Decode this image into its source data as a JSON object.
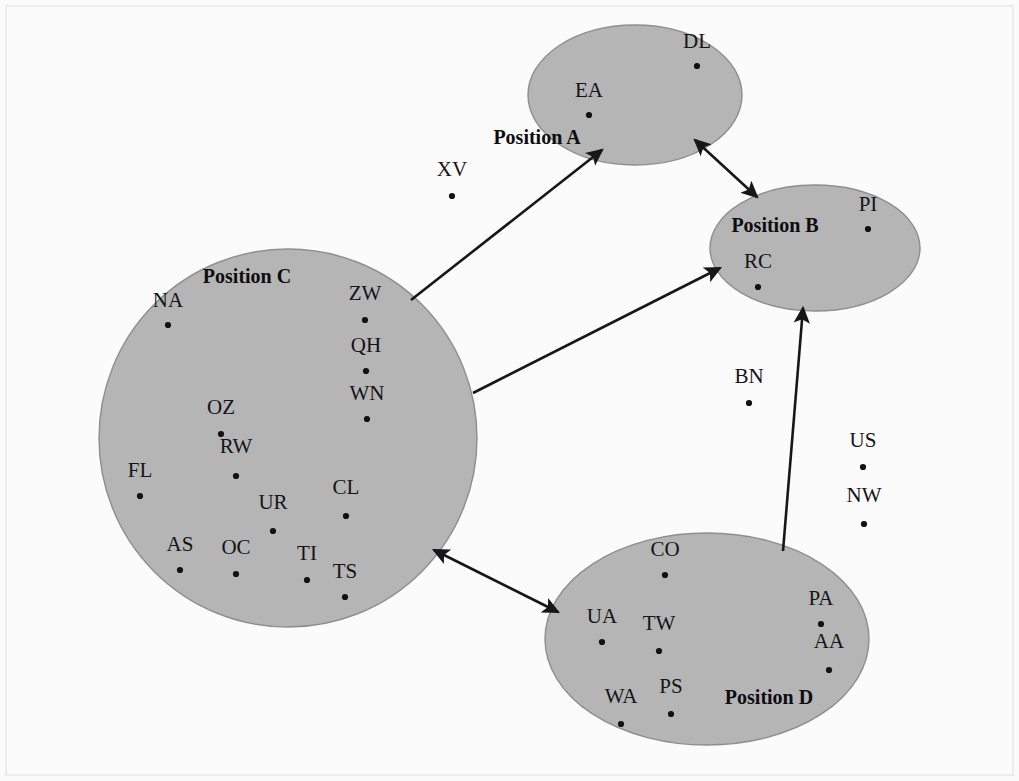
{
  "diagram": {
    "background_color": "#fbfbfb",
    "region_fill_color": "#b5b5b5",
    "region_stroke_color": "#8e8e8e",
    "arrow_color": "#17171a",
    "dot_color": "#121214",
    "text_color": "#141417"
  },
  "regions": [
    {
      "id": "position-a",
      "label": "Position A",
      "shape": "ellipse",
      "cx": 635,
      "cy": 95,
      "rx": 107,
      "ry": 70,
      "label_x": 537,
      "label_y": 144,
      "label_inside": false,
      "members": [
        {
          "name": "DL",
          "label_x": 697,
          "label_y": 48,
          "dot_x": 697,
          "dot_y": 66
        },
        {
          "name": "EA",
          "label_x": 589,
          "label_y": 97,
          "dot_x": 589,
          "dot_y": 115
        }
      ]
    },
    {
      "id": "position-b",
      "label": "Position B",
      "shape": "ellipse",
      "cx": 815,
      "cy": 248,
      "rx": 105,
      "ry": 63,
      "label_x": 775,
      "label_y": 232,
      "label_inside": true,
      "members": [
        {
          "name": "PI",
          "label_x": 868,
          "label_y": 211,
          "dot_x": 868,
          "dot_y": 229
        },
        {
          "name": "RC",
          "label_x": 758,
          "label_y": 268,
          "dot_x": 758,
          "dot_y": 287
        }
      ]
    },
    {
      "id": "position-c",
      "label": "Position C",
      "shape": "circle",
      "cx": 288,
      "cy": 438,
      "rx": 189,
      "ry": 189,
      "label_x": 247,
      "label_y": 283,
      "label_inside": true,
      "members": [
        {
          "name": "NA",
          "label_x": 168,
          "label_y": 307,
          "dot_x": 168,
          "dot_y": 325
        },
        {
          "name": "ZW",
          "label_x": 365,
          "label_y": 300,
          "dot_x": 365,
          "dot_y": 320
        },
        {
          "name": "QH",
          "label_x": 366,
          "label_y": 352,
          "dot_x": 366,
          "dot_y": 371
        },
        {
          "name": "WN",
          "label_x": 367,
          "label_y": 400,
          "dot_x": 367,
          "dot_y": 419
        },
        {
          "name": "OZ",
          "label_x": 221,
          "label_y": 414,
          "dot_x": 221,
          "dot_y": 434
        },
        {
          "name": "RW",
          "label_x": 236,
          "label_y": 453,
          "dot_x": 236,
          "dot_y": 476
        },
        {
          "name": "FL",
          "label_x": 140,
          "label_y": 477,
          "dot_x": 140,
          "dot_y": 496
        },
        {
          "name": "CL",
          "label_x": 346,
          "label_y": 494,
          "dot_x": 346,
          "dot_y": 516
        },
        {
          "name": "UR",
          "label_x": 273,
          "label_y": 509,
          "dot_x": 273,
          "dot_y": 531
        },
        {
          "name": "AS",
          "label_x": 180,
          "label_y": 551,
          "dot_x": 180,
          "dot_y": 570
        },
        {
          "name": "OC",
          "label_x": 236,
          "label_y": 554,
          "dot_x": 236,
          "dot_y": 574
        },
        {
          "name": "TI",
          "label_x": 307,
          "label_y": 560,
          "dot_x": 307,
          "dot_y": 580
        },
        {
          "name": "TS",
          "label_x": 345,
          "label_y": 578,
          "dot_x": 345,
          "dot_y": 597
        }
      ]
    },
    {
      "id": "position-d",
      "label": "Position D",
      "shape": "ellipse",
      "cx": 707,
      "cy": 639,
      "rx": 162,
      "ry": 106,
      "label_x": 769,
      "label_y": 704,
      "label_inside": true,
      "members": [
        {
          "name": "CO",
          "label_x": 665,
          "label_y": 556,
          "dot_x": 665,
          "dot_y": 575
        },
        {
          "name": "PA",
          "label_x": 821,
          "label_y": 605,
          "dot_x": 821,
          "dot_y": 624
        },
        {
          "name": "UA",
          "label_x": 602,
          "label_y": 623,
          "dot_x": 602,
          "dot_y": 642
        },
        {
          "name": "TW",
          "label_x": 659,
          "label_y": 630,
          "dot_x": 659,
          "dot_y": 651
        },
        {
          "name": "AA",
          "label_x": 829,
          "label_y": 648,
          "dot_x": 829,
          "dot_y": 670
        },
        {
          "name": "PS",
          "label_x": 671,
          "label_y": 693,
          "dot_x": 671,
          "dot_y": 714
        },
        {
          "name": "WA",
          "label_x": 621,
          "label_y": 703,
          "dot_x": 621,
          "dot_y": 724
        }
      ]
    }
  ],
  "outside_nodes": [
    {
      "name": "XV",
      "label_x": 452,
      "label_y": 176,
      "dot_x": 452,
      "dot_y": 196
    },
    {
      "name": "BN",
      "label_x": 749,
      "label_y": 383,
      "dot_x": 749,
      "dot_y": 403
    },
    {
      "name": "US",
      "label_x": 863,
      "label_y": 447,
      "dot_x": 863,
      "dot_y": 467
    },
    {
      "name": "NW",
      "label_x": 864,
      "label_y": 502,
      "dot_x": 864,
      "dot_y": 524
    }
  ],
  "connections": [
    {
      "id": "c-to-a",
      "from": "position-c",
      "to": "position-a",
      "x1": 411,
      "y1": 300,
      "x2": 602,
      "y2": 150,
      "arrow_start": false,
      "arrow_end": true
    },
    {
      "id": "a-to-b",
      "from": "position-a",
      "to": "position-b",
      "x1": 695,
      "y1": 140,
      "x2": 757,
      "y2": 197,
      "arrow_start": true,
      "arrow_end": true
    },
    {
      "id": "c-to-b",
      "from": "position-c",
      "to": "position-b",
      "x1": 473,
      "y1": 393,
      "x2": 720,
      "y2": 268,
      "arrow_start": false,
      "arrow_end": true
    },
    {
      "id": "c-to-d",
      "from": "position-c",
      "to": "position-d",
      "x1": 434,
      "y1": 550,
      "x2": 558,
      "y2": 612,
      "arrow_start": true,
      "arrow_end": true
    },
    {
      "id": "d-to-b",
      "from": "position-d",
      "to": "position-b",
      "x1": 783,
      "y1": 551,
      "x2": 803,
      "y2": 308,
      "arrow_start": false,
      "arrow_end": true
    }
  ]
}
